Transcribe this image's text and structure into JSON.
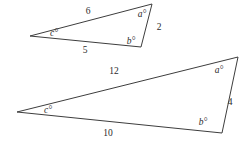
{
  "figure": {
    "background_color": "#ffffff",
    "stroke_color": "#3d3d3d",
    "text_color": "#2b2b2b",
    "shapes": [
      {
        "name": "small-triangle",
        "vertices": {
          "left": [
            30,
            36
          ],
          "top_right": [
            152,
            4
          ],
          "bottom_right": [
            141,
            47
          ]
        },
        "side_labels": {
          "top": "6",
          "bottom": "5",
          "right": "2"
        },
        "angle_labels": {
          "top_right": "a°",
          "bottom_right": "b°",
          "left": "c°"
        },
        "label_positions": {
          "top": [
            88,
            14
          ],
          "bottom": [
            85,
            53
          ],
          "right": [
            159,
            30
          ],
          "angle_top_right": [
            142,
            17
          ],
          "angle_bottom_right": [
            131,
            44
          ],
          "angle_left": [
            54,
            36
          ]
        }
      },
      {
        "name": "large-triangle",
        "vertices": {
          "left": [
            17,
            112
          ],
          "top_right": [
            238,
            57
          ],
          "bottom_right": [
            222,
            133
          ]
        },
        "side_labels": {
          "top": "12",
          "bottom": "10",
          "right": "4"
        },
        "angle_labels": {
          "top_right": "a°",
          "bottom_right": "b°",
          "left": "c°"
        },
        "label_positions": {
          "top": [
            114,
            74
          ],
          "bottom": [
            108,
            136
          ],
          "right": [
            230,
            105
          ],
          "angle_top_right": [
            219,
            73
          ],
          "angle_bottom_right": [
            203,
            125
          ],
          "angle_left": [
            48,
            113
          ]
        }
      }
    ]
  }
}
